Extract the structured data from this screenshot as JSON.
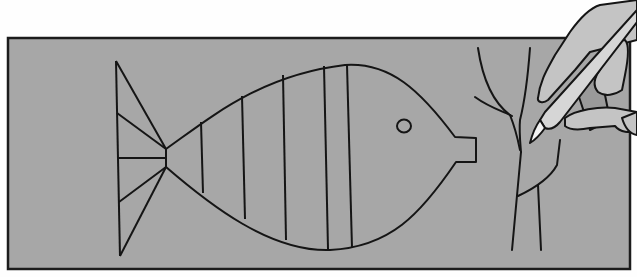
{
  "scene": {
    "description": "Line illustration: a hand holding a pen tracing a fish outline and a twig on a gray board",
    "colors": {
      "background": "#fefefe",
      "board": "#a7a7a7",
      "board_edge": "#1c1c1c",
      "ink": "#151515",
      "hand_fill": "#c4c4c4",
      "hand_shadow": "#9a9a9a",
      "pen_body": "#d6d6d6",
      "pen_tip": "#f2f2f2"
    }
  },
  "elements": {
    "board": "gray-board",
    "fish": "fish-outline",
    "twig": "twig-outline",
    "hand": "hand-holding-pen"
  }
}
